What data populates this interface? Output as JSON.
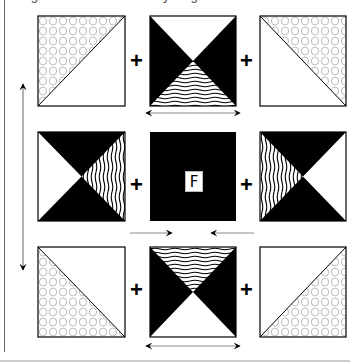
{
  "caption": "Figure 3 - Block assembly diagram",
  "center_label": "F",
  "plus_symbol": "+",
  "colors": {
    "ink": "#000000",
    "paper": "#ffffff",
    "pattern": "#aaaaaa",
    "rule": "#888888"
  },
  "layout": {
    "columns_x": [
      38,
      150,
      260
    ],
    "rows_y": [
      16,
      132,
      247
    ],
    "block_size": 87
  },
  "blocks": [
    {
      "row": 1,
      "col": 1,
      "type": "half-square-triangle",
      "pattern_side": "upper-left",
      "pattern": "circles"
    },
    {
      "row": 1,
      "col": 2,
      "type": "hourglass",
      "dark_sides": [
        "left",
        "right"
      ],
      "top": "white",
      "bottom": "wavy"
    },
    {
      "row": 1,
      "col": 3,
      "type": "half-square-triangle",
      "pattern_side": "upper-right",
      "pattern": "circles"
    },
    {
      "row": 2,
      "col": 1,
      "type": "hourglass",
      "dark_sides": [
        "top",
        "bottom"
      ],
      "left": "white",
      "right": "wavy"
    },
    {
      "row": 2,
      "col": 2,
      "type": "solid",
      "fill": "black",
      "label": "F"
    },
    {
      "row": 2,
      "col": 3,
      "type": "hourglass",
      "dark_sides": [
        "top",
        "bottom"
      ],
      "left": "wavy",
      "right": "white"
    },
    {
      "row": 3,
      "col": 1,
      "type": "half-square-triangle",
      "pattern_side": "lower-left",
      "pattern": "circles"
    },
    {
      "row": 3,
      "col": 2,
      "type": "hourglass",
      "dark_sides": [
        "left",
        "right"
      ],
      "top": "wavy",
      "bottom": "white"
    },
    {
      "row": 3,
      "col": 3,
      "type": "half-square-triangle",
      "pattern_side": "lower-right",
      "pattern": "circles"
    }
  ],
  "arrows": [
    {
      "name": "vertical-double-arrow",
      "direction": "up-down"
    },
    {
      "name": "top-horizontal-double-arrow",
      "direction": "left-right"
    },
    {
      "name": "bottom-horizontal-double-arrow",
      "direction": "left-right"
    },
    {
      "name": "center-left-arrow",
      "direction": "right"
    },
    {
      "name": "center-right-arrow",
      "direction": "left"
    }
  ]
}
